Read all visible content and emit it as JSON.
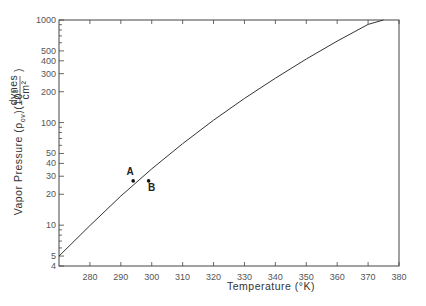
{
  "chart_data": {
    "type": "line",
    "title": "",
    "xlabel": "Temperature (°K)",
    "ylabel_main": "Vapor Pressure (ρ",
    "ylabel_sub": "ov",
    "ylabel_mid": ")(10",
    "ylabel_sup": "3",
    "ylabel_frac_num": "dynes",
    "ylabel_frac_den": "cm²",
    "ylabel_close": ")",
    "xlim": [
      270,
      380
    ],
    "ylim": [
      4,
      1000
    ],
    "yscale": "log",
    "grid": false,
    "x_ticks": [
      280,
      290,
      300,
      310,
      320,
      330,
      340,
      350,
      360,
      370,
      380
    ],
    "x_tick_labels": [
      "280",
      "290",
      "300",
      "310",
      "320",
      "330",
      "340",
      "350",
      "360",
      "370",
      "380"
    ],
    "y_major_ticks": [
      4,
      5,
      10,
      20,
      30,
      40,
      50,
      100,
      200,
      300,
      400,
      500,
      1000
    ],
    "y_tick_labels": [
      "4",
      "5",
      "10",
      "20",
      "30",
      "40",
      "50",
      "100",
      "200",
      "300",
      "400",
      "500",
      "1000"
    ],
    "y_minor_ticks": [
      6,
      7,
      8,
      9,
      60,
      70,
      80,
      90,
      600,
      700,
      800,
      900
    ],
    "series": [
      {
        "name": "vapor-pressure-curve",
        "x": [
          270,
          280,
          290,
          300,
          310,
          320,
          330,
          340,
          350,
          360,
          370,
          375
        ],
        "y": [
          5.0,
          9.9,
          19.2,
          35.4,
          62.3,
          105.4,
          172.0,
          271.0,
          417.0,
          623.0,
          906.0,
          1000.0
        ]
      }
    ],
    "points": [
      {
        "label": "A",
        "x": 294,
        "y": 27
      },
      {
        "label": "B",
        "x": 299,
        "y": 27
      }
    ]
  }
}
